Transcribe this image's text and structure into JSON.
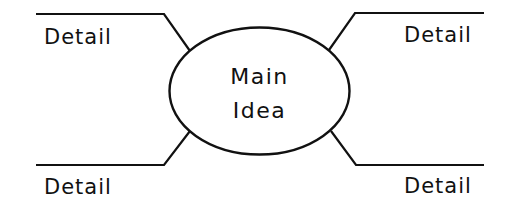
{
  "diagram": {
    "type": "main-idea-and-details-web",
    "center": {
      "shape": "ellipse",
      "label_lines": [
        "Main",
        "Idea"
      ]
    },
    "details": [
      {
        "position": "top-left",
        "label": "Detail"
      },
      {
        "position": "top-right",
        "label": "Detail"
      },
      {
        "position": "bottom-left",
        "label": "Detail"
      },
      {
        "position": "bottom-right",
        "label": "Detail"
      }
    ],
    "colors": {
      "stroke": "#111111",
      "background": "#ffffff",
      "text": "#111111"
    }
  }
}
